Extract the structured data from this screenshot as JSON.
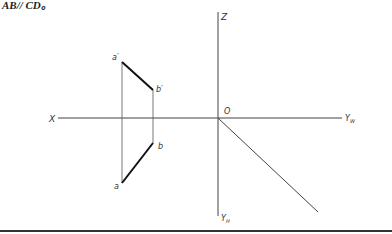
{
  "caption": "AB// CD。",
  "axes": {
    "x_label": "X",
    "z_label": "Z",
    "origin_label": "O",
    "yw_label": "Yw",
    "yh_label": "YH"
  },
  "points": {
    "a_prime": "a′",
    "b_prime": "b′",
    "a": "a",
    "b": "b"
  },
  "colors": {
    "line": "#333333",
    "thick_line": "#111111"
  }
}
